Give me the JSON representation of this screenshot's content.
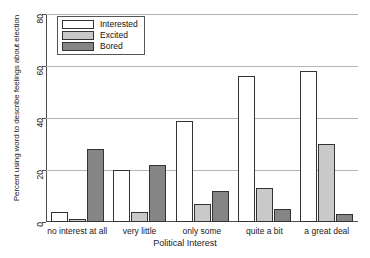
{
  "chart_data": {
    "type": "bar",
    "title": "",
    "xlabel": "Political Interest",
    "ylabel": "Percent using word to describe feelings about election",
    "categories": [
      "no interest at all",
      "very little",
      "only some",
      "quite a bit",
      "a great deal"
    ],
    "series": [
      {
        "name": "Interested",
        "color": "#ffffff",
        "values": [
          4,
          20,
          39,
          56,
          58
        ]
      },
      {
        "name": "Excited",
        "color": "#c9c9c9",
        "values": [
          1,
          4,
          7,
          13,
          30
        ]
      },
      {
        "name": "Bored",
        "color": "#858585",
        "values": [
          28,
          22,
          12,
          5,
          3
        ]
      }
    ],
    "ylim": [
      0,
      80
    ],
    "yticks": [
      0,
      20,
      40,
      60,
      80
    ],
    "ytick_labels": [
      "0",
      "20",
      "40",
      "60",
      "80"
    ],
    "grid": true,
    "legend_position": "top-left"
  },
  "legend": {
    "items": [
      {
        "label": "Interested"
      },
      {
        "label": "Excited"
      },
      {
        "label": "Bored"
      }
    ]
  }
}
